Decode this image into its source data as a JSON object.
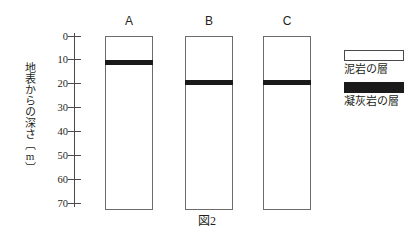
{
  "figure": {
    "caption": "図2",
    "axis": {
      "title": "地表からの深さ〔m〕",
      "unit": "m",
      "ticks": [
        "0",
        "10",
        "20",
        "30",
        "40",
        "50",
        "60",
        "70"
      ],
      "min": 0,
      "max": 70
    },
    "columns": [
      {
        "label": "A",
        "top_depth": 0,
        "bottom_depth": 70,
        "tuff_depth": 10
      },
      {
        "label": "B",
        "top_depth": 0,
        "bottom_depth": 70,
        "tuff_depth": 20
      },
      {
        "label": "C",
        "top_depth": 0,
        "bottom_depth": 70,
        "tuff_depth": 20
      }
    ],
    "legend": [
      {
        "label": "泥岩の層",
        "color": "#ffffff",
        "key": "mudstone"
      },
      {
        "label": "凝灰岩の層",
        "color": "#1a1a1a",
        "key": "tuff"
      }
    ]
  },
  "chart_data": {
    "type": "bar",
    "title": "図2",
    "xlabel": "",
    "ylabel": "地表からの深さ〔m〕",
    "ylim": [
      0,
      70
    ],
    "y_ticks": [
      0,
      10,
      20,
      30,
      40,
      50,
      60,
      70
    ],
    "y_inverted": true,
    "grid": false,
    "legend_position": "right",
    "categories": [
      "A",
      "B",
      "C"
    ],
    "series": [
      {
        "name": "凝灰岩の層",
        "values": [
          10,
          20,
          20
        ]
      }
    ],
    "annotations": [
      "A 柱状図の凝灰岩層は深さ10m",
      "B 柱状図の凝灰岩層は深さ20m",
      "C 柱状図の凝灰岩層は深さ20m"
    ]
  }
}
